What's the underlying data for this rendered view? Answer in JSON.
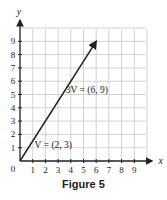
{
  "chart_data": {
    "type": "line",
    "title": "",
    "caption": "Figure 5",
    "xlabel": "x",
    "ylabel": "y",
    "xlim": [
      0,
      10
    ],
    "ylim": [
      0,
      10
    ],
    "grid": true,
    "origin_label": "0",
    "x_ticks": [
      "1",
      "2",
      "3",
      "4",
      "5",
      "6",
      "7",
      "8",
      "9"
    ],
    "y_ticks": [
      "1",
      "2",
      "3",
      "4",
      "5",
      "6",
      "7",
      "8",
      "9"
    ],
    "series": [
      {
        "name": "3V",
        "points": [
          [
            0,
            0
          ],
          [
            6,
            9
          ]
        ],
        "arrow": true,
        "label": "3V = (6, 9)"
      },
      {
        "name": "V",
        "points": [
          [
            0,
            0
          ],
          [
            2,
            3
          ]
        ],
        "arrow": true,
        "label": "V = (2, 3)"
      }
    ]
  },
  "colors": {
    "grid": "#c8c8c8",
    "axis": "#222222",
    "vector": "#222222"
  }
}
